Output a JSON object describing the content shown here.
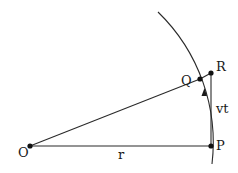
{
  "diagram": {
    "type": "geometry",
    "points": {
      "O": {
        "label": "O",
        "x": 30,
        "y": 146
      },
      "P": {
        "label": "P",
        "x": 211,
        "y": 146
      },
      "Q": {
        "label": "Q",
        "x": 200,
        "y": 79
      },
      "R": {
        "label": "R",
        "x": 211,
        "y": 73
      }
    },
    "segment_labels": {
      "OP": "r",
      "PR": "vt"
    },
    "colors": {
      "stroke": "#2a2a2a",
      "background": "#ffffff"
    }
  }
}
